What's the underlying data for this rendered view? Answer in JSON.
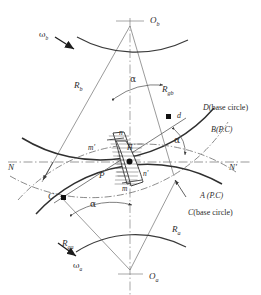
{
  "figure": {
    "background_color": "#ffffff",
    "line_color": "#3a3a3a",
    "text_color": "#2b2b2b"
  },
  "labels": {
    "center_upper": "O",
    "center_upper_sub": "b",
    "center_lower": "O",
    "center_lower_sub": "a",
    "omega_upper": "ω",
    "omega_upper_sub": "b",
    "omega_lower": "ω",
    "omega_lower_sub": "a",
    "radius_b": "R",
    "radius_b_sub": "b",
    "radius_gb": "R",
    "radius_gb_sub": "gb",
    "radius_a": "R",
    "radius_a_sub": "a",
    "radius_ga": "R",
    "radius_ga_sub": "ga",
    "alpha_top": "α",
    "alpha_right": "α",
    "alpha_bottom": "α",
    "curve_d": "D",
    "curve_d_note": "(base circle)",
    "curve_b": "B",
    "curve_b_note": "(P.C)",
    "curve_a": "A",
    "curve_a_note": "(P.C)",
    "curve_c": "C",
    "curve_c_note": "(base circle)",
    "line_n_left": "N",
    "line_n_right": "N'",
    "point_d": "d",
    "point_c": "C",
    "point_p": "P",
    "point_n": "n",
    "point_n_prime": "n'",
    "point_m": "m",
    "point_m_prime": "m'",
    "point_h": "H"
  }
}
